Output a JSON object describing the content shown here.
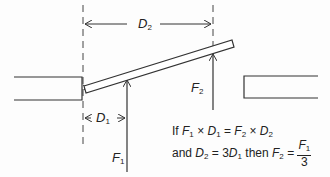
{
  "diagram": {
    "type": "lever-mechanics",
    "labels": {
      "d2": {
        "symbol": "D",
        "sub": "2"
      },
      "d1": {
        "symbol": "D",
        "sub": "1"
      },
      "f1": {
        "symbol": "F",
        "sub": "1"
      },
      "f2": {
        "symbol": "F",
        "sub": "2"
      }
    },
    "formula": {
      "line1_prefix": "If ",
      "line1": [
        {
          "sym": "F",
          "sub": "1"
        },
        {
          "op": " × "
        },
        {
          "sym": "D",
          "sub": "1"
        },
        {
          "op": " = "
        },
        {
          "sym": "F",
          "sub": "2"
        },
        {
          "op": " × "
        },
        {
          "sym": "D",
          "sub": "2"
        }
      ],
      "line2_prefix": "and ",
      "line2_text": {
        "d2_sym": "D",
        "d2_sub": "2",
        "eq": " = 3",
        "d1_sym": "D",
        "d1_sub": "1",
        "then": " then ",
        "f2_sym": "F",
        "f2_sub": "2",
        "eq2": " = "
      },
      "fraction": {
        "num_sym": "F",
        "num_sub": "1",
        "den": "3"
      }
    },
    "colors": {
      "line": "#333333",
      "text": "#222222"
    }
  }
}
